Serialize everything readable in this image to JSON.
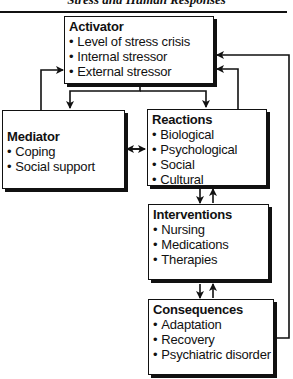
{
  "header": {
    "title": "Stress and Human Responses"
  },
  "boxes": {
    "activator": {
      "title": "Activator",
      "items": [
        "Level of stress crisis",
        "Internal stressor",
        "External stressor"
      ]
    },
    "mediator": {
      "title": "Mediator",
      "items": [
        "Coping",
        "Social support"
      ]
    },
    "reactions": {
      "title": "Reactions",
      "items": [
        "Biological",
        "Psychological",
        "Social",
        "Cultural"
      ]
    },
    "interventions": {
      "title": "Interventions",
      "items": [
        "Nursing",
        "Medications",
        "Therapies"
      ]
    },
    "consequences": {
      "title": "Consequences",
      "items": [
        "Adaptation",
        "Recovery",
        "Psychiatric disorder"
      ]
    }
  },
  "colors": {
    "ink": "#111111",
    "background": "#ffffff"
  }
}
